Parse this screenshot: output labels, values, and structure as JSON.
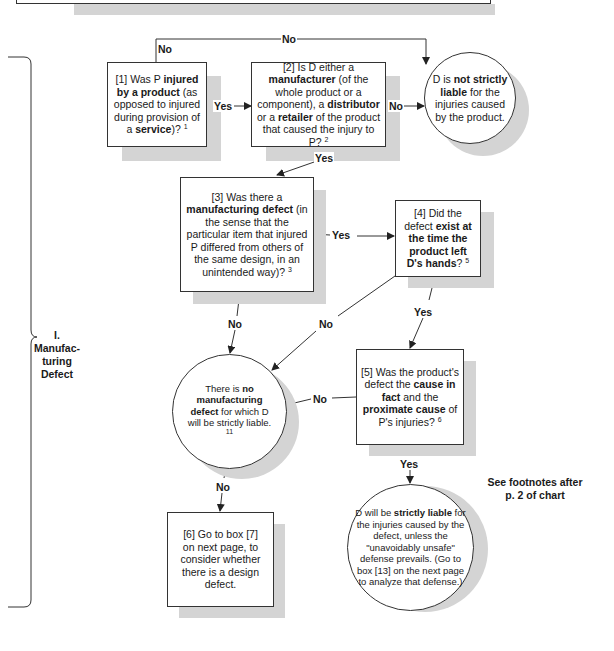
{
  "section": {
    "number": "I.",
    "title_line1": "Manufac-",
    "title_line2": "turing",
    "title_line3": "Defect"
  },
  "nodes": {
    "box1": {
      "id": "[1]",
      "pre": " Was P ",
      "bold1": "injured by a product",
      "mid": " (as opposed to injured during provision of a ",
      "bold2": "service",
      "post": ")? ",
      "footnote": "1"
    },
    "box2": {
      "id": "[2]",
      "pre": " Is D either a ",
      "bold1": "manufacturer",
      "mid1": " (of the whole product or a component), a ",
      "bold2": "distributor",
      "mid2": " or a ",
      "bold3": "retailer",
      "post": " of the product that caused the injury to P? ",
      "footnote": "2"
    },
    "not_liable": {
      "pre": "D is ",
      "bold1": "not strictly liable",
      "post": " for the injuries caused by the product."
    },
    "box3": {
      "id": "[3]",
      "pre": " Was there a ",
      "bold1": "manufacturing defect",
      "post": " (in the sense that the particular item that injured P differed from others of the same design, in an unintended way)? ",
      "footnote": "3"
    },
    "box4": {
      "id": "[4]",
      "pre": " Did the defect ",
      "bold1": "exist at the time the product left D's hands",
      "post": "? ",
      "footnote": "5"
    },
    "no_defect": {
      "pre": "There is ",
      "bold1": "no manufacturing defect",
      "post": " for which D will be strictly liable. ",
      "footnote": "11"
    },
    "box5": {
      "id": "[5]",
      "pre": " Was the product's defect the ",
      "bold1": "cause in fact",
      "mid": " and the ",
      "bold2": "proximate cause",
      "post": " of P's injuries? ",
      "footnote": "6"
    },
    "box6": {
      "text": "[6] Go to box [7] on next page, to consider whether there is a design defect."
    },
    "liable": {
      "pre": "D will be ",
      "bold1": "strictly liable",
      "post": " for the injuries caused by the defect, unless the \"unavoidably unsafe\" defense prevails. (Go to box [13] on the next page to analyze that defense.)"
    }
  },
  "edges": {
    "yes": "Yes",
    "no": "No"
  },
  "footnote_note": {
    "line1": "See footnotes after",
    "line2": "p. 2 of chart"
  },
  "colors": {
    "line": "#333333",
    "shadow": "#d4d4d4",
    "background": "#ffffff"
  }
}
